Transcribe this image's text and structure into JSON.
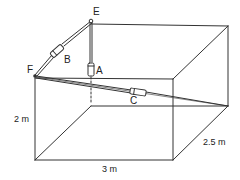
{
  "diagram": {
    "type": "3d-box-with-cables",
    "points": {
      "E": {
        "label": "E"
      },
      "F": {
        "label": "F"
      }
    },
    "springs": [
      {
        "id": "A",
        "label": "A"
      },
      {
        "id": "B",
        "label": "B"
      },
      {
        "id": "C",
        "label": "C"
      }
    ],
    "dimensions": {
      "height": "2 m",
      "width": "3 m",
      "depth": "2.5 m"
    },
    "colors": {
      "line": "#333333",
      "background": "#ffffff"
    }
  }
}
